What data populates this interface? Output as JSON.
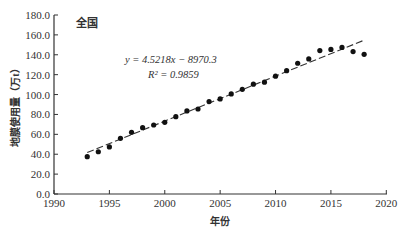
{
  "chart_data": {
    "type": "scatter",
    "panel_label": "全国",
    "xlabel": "年份",
    "ylabel": "地膜使用量（万t）",
    "xlim": [
      1990,
      2020
    ],
    "ylim": [
      0,
      180
    ],
    "xticks": [
      1990,
      1995,
      2000,
      2005,
      2010,
      2015,
      2020
    ],
    "yticks": [
      "0.0",
      "20.0",
      "40.0",
      "60.0",
      "80.0",
      "100.0",
      "120.0",
      "140.0",
      "160.0",
      "180.0"
    ],
    "grid": false,
    "series": [
      {
        "name": "地膜使用量",
        "marker": "filled-circle",
        "x": [
          1993,
          1994,
          1995,
          1996,
          1997,
          1998,
          1999,
          2000,
          2001,
          2002,
          2003,
          2004,
          2005,
          2006,
          2007,
          2008,
          2009,
          2010,
          2011,
          2012,
          2013,
          2014,
          2015,
          2016,
          2017,
          2018
        ],
        "y": [
          37.5,
          42.5,
          47.3,
          56.0,
          62.0,
          66.7,
          69.4,
          72.1,
          77.8,
          83.5,
          85.5,
          92.9,
          95.6,
          100.6,
          105.3,
          110.4,
          112.4,
          118.5,
          124.0,
          131.5,
          135.8,
          144.2,
          145.4,
          147.4,
          143.2,
          140.5
        ]
      }
    ],
    "trendline": {
      "style": "dashed",
      "slope": 4.5218,
      "intercept": -8970.3,
      "x_range": [
        1993,
        2018
      ],
      "equation_text": "y = 4.5218x − 8970.3",
      "r2_text": "R² = 0.9859"
    }
  }
}
